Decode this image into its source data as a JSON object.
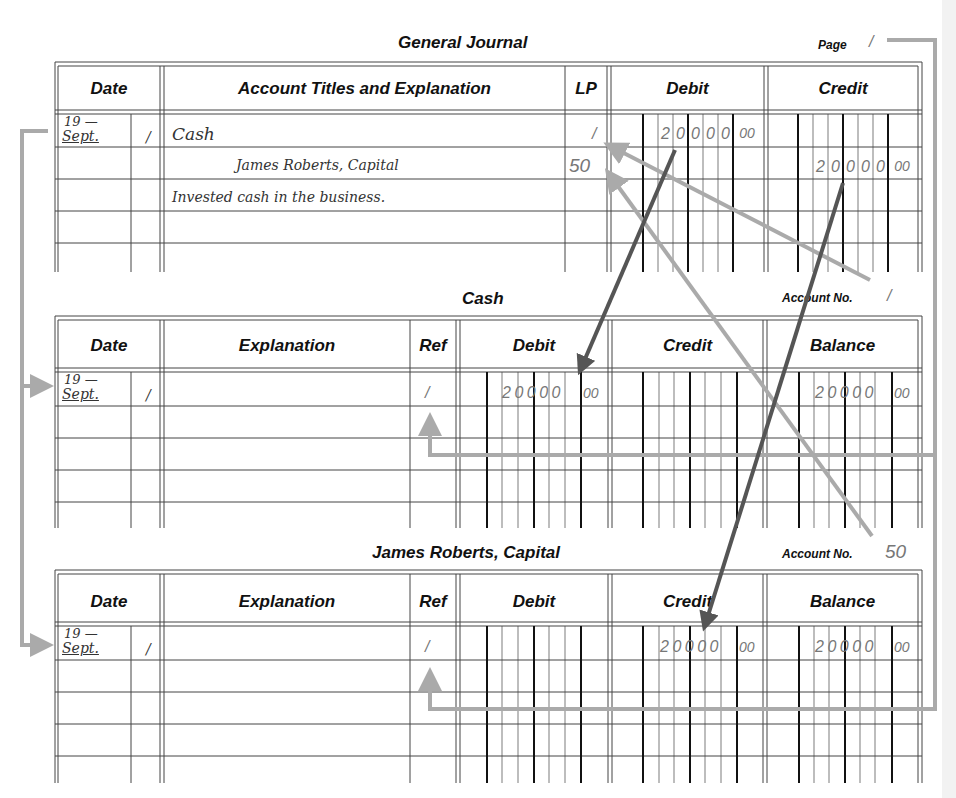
{
  "journal": {
    "title": "General Journal",
    "page_label": "Page",
    "page_number": "/",
    "headers": {
      "date": "Date",
      "account": "Account Titles and Explanation",
      "lp": "LP",
      "debit": "Debit",
      "credit": "Credit"
    },
    "entries": [
      {
        "year": "19 —",
        "month": "Sept.",
        "day": "/",
        "account": "Cash",
        "lp": "/",
        "debit_digits": [
          "2",
          "0",
          "0",
          "0",
          "0"
        ],
        "debit_cents": "00",
        "credit_digits": [],
        "credit_cents": ""
      },
      {
        "year": "",
        "month": "",
        "day": "",
        "account": "James Roberts, Capital",
        "lp": "50",
        "debit_digits": [],
        "debit_cents": "",
        "credit_digits": [
          "2",
          "0",
          "0",
          "0",
          "0"
        ],
        "credit_cents": "00"
      },
      {
        "year": "",
        "month": "",
        "day": "",
        "account": "Invested cash in the business.",
        "lp": "",
        "debit_digits": [],
        "debit_cents": "",
        "credit_digits": [],
        "credit_cents": ""
      }
    ]
  },
  "ledgers": [
    {
      "title": "Cash",
      "account_no_label": "Account No.",
      "account_no": "/",
      "headers": {
        "date": "Date",
        "explanation": "Explanation",
        "ref": "Ref",
        "debit": "Debit",
        "credit": "Credit",
        "balance": "Balance"
      },
      "entries": [
        {
          "year": "19 —",
          "month": "Sept.",
          "day": "/",
          "explanation": "",
          "ref": "/",
          "debit": "20000",
          "debit_cents": "00",
          "credit": "",
          "credit_cents": "",
          "balance": "20000",
          "balance_cents": "00"
        }
      ]
    },
    {
      "title": "James Roberts, Capital",
      "account_no_label": "Account No.",
      "account_no": "50",
      "headers": {
        "date": "Date",
        "explanation": "Explanation",
        "ref": "Ref",
        "debit": "Debit",
        "credit": "Credit",
        "balance": "Balance"
      },
      "entries": [
        {
          "year": "19 —",
          "month": "Sept.",
          "day": "/",
          "explanation": "",
          "ref": "/",
          "debit": "",
          "debit_cents": "",
          "credit": "20000",
          "credit_cents": "00",
          "balance": "20000",
          "balance_cents": "00"
        }
      ]
    }
  ],
  "annotations": {
    "arrow_color_dark": "#555555",
    "arrow_color_light": "#aaaaaa",
    "arrows": [
      "Journal debit 2,000.00 posted to Cash ledger Debit",
      "Journal credit 2,000.00 posted to James Roberts, Capital ledger Credit",
      "Cash Account No. 1 written to journal LP column",
      "Capital Account No. 50 written to journal LP column",
      "Journal date carried to ledger dates",
      "Journal page number 1 written to ledger Ref columns"
    ]
  }
}
